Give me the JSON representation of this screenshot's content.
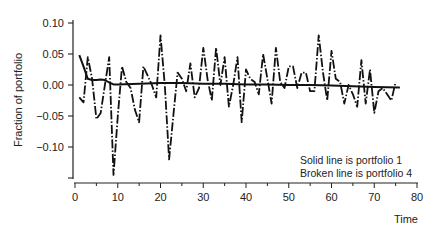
{
  "chart_data": {
    "type": "line",
    "title": "",
    "xlabel": "Time",
    "ylabel": "Fraction of portfolio",
    "xlim": [
      0,
      80
    ],
    "ylim": [
      -0.15,
      0.1
    ],
    "x_ticks": [
      0,
      10,
      20,
      30,
      40,
      50,
      60,
      70,
      80
    ],
    "x_tick_labels": [
      "0",
      "10",
      "20",
      "30",
      "40",
      "50",
      "60",
      "70",
      "80"
    ],
    "y_ticks": [
      0.1,
      0.05,
      0.0,
      -0.05,
      -0.1
    ],
    "y_tick_labels": [
      "0.10",
      "0.05",
      "0.00",
      "−0.05",
      "−0.10"
    ],
    "grid": false,
    "legend_position": "lower right (annotation text)",
    "annotations": [
      "Solid line is portfolio 1",
      "Broken line is portfolio 4"
    ],
    "series": [
      {
        "name": "Portfolio 1",
        "style": "solid",
        "x": [
          1,
          2,
          3,
          4,
          5,
          6,
          7,
          8,
          9,
          10,
          15,
          20,
          25,
          30,
          35,
          40,
          45,
          50,
          55,
          60,
          65,
          70,
          76
        ],
        "values": [
          0.048,
          0.03,
          0.01,
          0.008,
          0.008,
          0.009,
          0.008,
          0.004,
          0.001,
          0.001,
          0.002,
          0.003,
          0.003,
          0.002,
          0.002,
          0.001,
          0.001,
          0.0,
          0.0,
          -0.001,
          -0.002,
          -0.003,
          -0.004
        ]
      },
      {
        "name": "Portfolio 4",
        "style": "dash-dot",
        "x": [
          1,
          2,
          3,
          4,
          5,
          6,
          7,
          8,
          9,
          10,
          11,
          12,
          13,
          14,
          15,
          16,
          17,
          18,
          19,
          20,
          21,
          22,
          23,
          24,
          25,
          26,
          27,
          28,
          29,
          30,
          31,
          32,
          33,
          34,
          35,
          36,
          37,
          38,
          39,
          40,
          41,
          42,
          43,
          44,
          45,
          46,
          47,
          48,
          49,
          50,
          51,
          52,
          53,
          54,
          55,
          56,
          57,
          58,
          59,
          60,
          61,
          62,
          63,
          64,
          65,
          66,
          67,
          68,
          69,
          70,
          71,
          72,
          73,
          74,
          75
        ],
        "values": [
          -0.02,
          -0.028,
          0.045,
          0.01,
          -0.055,
          -0.045,
          0.0,
          0.045,
          -0.145,
          -0.05,
          0.03,
          0.005,
          -0.005,
          -0.04,
          -0.06,
          0.03,
          0.015,
          0.0,
          -0.02,
          0.08,
          0.0,
          -0.12,
          -0.05,
          0.02,
          0.01,
          -0.01,
          0.035,
          -0.02,
          -0.005,
          0.06,
          0.01,
          -0.025,
          0.06,
          0.0,
          0.045,
          -0.035,
          0.0,
          0.045,
          -0.06,
          0.025,
          0.01,
          0.005,
          -0.015,
          0.05,
          0.01,
          -0.03,
          0.06,
          0.005,
          -0.005,
          0.03,
          0.03,
          -0.005,
          0.02,
          0.02,
          -0.01,
          -0.01,
          0.08,
          0.02,
          -0.025,
          0.055,
          0.01,
          0.005,
          -0.03,
          0.0,
          -0.015,
          -0.035,
          0.04,
          -0.03,
          0.025,
          -0.045,
          -0.01,
          -0.005,
          -0.015,
          -0.025,
          0.005
        ]
      }
    ]
  }
}
